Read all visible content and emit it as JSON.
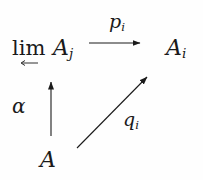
{
  "diagram": {
    "type": "commutative-diagram",
    "nodes": {
      "limit": {
        "operator": "lim",
        "under_arrow": "←",
        "base": "A",
        "subscript": "j"
      },
      "target": {
        "base": "A",
        "subscript": "i"
      },
      "source": {
        "base": "A"
      }
    },
    "arrows": {
      "top": {
        "from": "limit",
        "to": "target",
        "label_base": "p",
        "label_subscript": "i",
        "direction": "right"
      },
      "left": {
        "from": "source",
        "to": "limit",
        "label": "α",
        "direction": "up"
      },
      "diagonal": {
        "from": "source",
        "to": "target",
        "label_base": "q",
        "label_subscript": "i",
        "direction": "up-right"
      }
    },
    "colors": {
      "ink": "#1a1a1a",
      "background": "#fefefe"
    }
  }
}
